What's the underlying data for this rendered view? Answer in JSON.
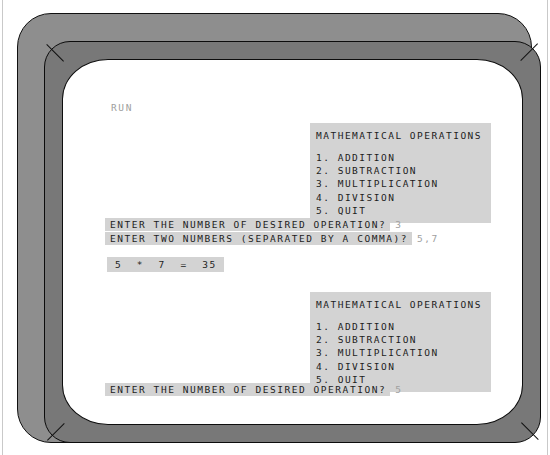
{
  "device": {
    "name": "crt-monitor",
    "bezel_outer_color": "#8e8e8e",
    "bezel_inner_color": "#787878",
    "screen_color": "#ffffff"
  },
  "terminal": {
    "run_command": "RUN",
    "output_highlight_color": "#d3d3d3",
    "output_text_color": "#1c1c1c",
    "user_input_color": "#a0a0a0",
    "menu": {
      "title": "MATHEMATICAL OPERATIONS",
      "items": [
        "1. ADDITION",
        "2. SUBTRACTION",
        "3. MULTIPLICATION",
        "4. DIVISION",
        "5. QUIT"
      ]
    },
    "session": {
      "prompt_operation": "ENTER THE NUMBER OF DESIRED OPERATION?",
      "answer_operation_1": "3",
      "prompt_numbers": "ENTER TWO NUMBERS (SEPARATED BY A COMMA)?",
      "answer_numbers": "5,7",
      "result": "5  *  7  =  35",
      "answer_operation_2": "5"
    }
  }
}
